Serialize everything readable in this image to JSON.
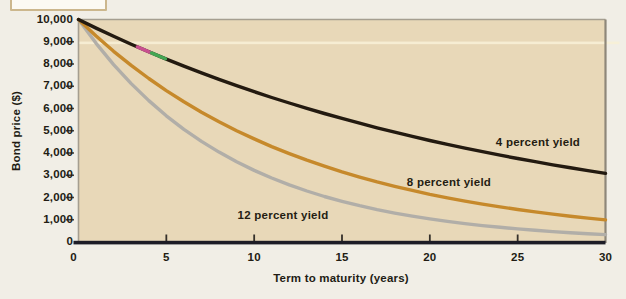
{
  "chart_data": {
    "type": "line",
    "title": "",
    "xlabel": "Term to maturity (years)",
    "ylabel": "Bond price ($)",
    "xlim": [
      0,
      30
    ],
    "ylim": [
      0,
      10000
    ],
    "x_ticks": [
      0,
      5,
      10,
      15,
      20,
      25,
      30
    ],
    "y_ticks": [
      0,
      1000,
      2000,
      3000,
      4000,
      5000,
      6000,
      7000,
      8000,
      9000,
      10000
    ],
    "grid": false,
    "legend": "inline-labels",
    "plot_bg_color": "#e8d8b8",
    "page_bg_color": "#f1eee6",
    "axis_color": "#1d1c26",
    "text_color": "#221c14",
    "x": [
      0,
      1,
      2,
      3,
      4,
      5,
      6,
      7,
      8,
      9,
      10,
      11,
      12,
      13,
      14,
      15,
      16,
      17,
      18,
      19,
      20,
      21,
      22,
      23,
      24,
      25,
      26,
      27,
      28,
      29,
      30
    ],
    "series": [
      {
        "name": "12 percent yield",
        "color": "#b1aea8",
        "label_pos": {
          "x": 283,
          "y": 215
        },
        "values": [
          10000,
          8929,
          7972,
          7118,
          6355,
          5674,
          5066,
          4523,
          4039,
          3606,
          3220,
          2875,
          2567,
          2292,
          2046,
          1827,
          1631,
          1456,
          1300,
          1161,
          1037,
          926,
          826,
          738,
          659,
          588,
          525,
          469,
          419,
          374,
          334
        ]
      },
      {
        "name": "8 percent yield",
        "color": "#c6892b",
        "label_pos": {
          "x": 449,
          "y": 182
        },
        "values": [
          10000,
          9259,
          8573,
          7938,
          7350,
          6806,
          6302,
          5835,
          5403,
          5002,
          4632,
          4289,
          3971,
          3677,
          3405,
          3152,
          2919,
          2703,
          2502,
          2317,
          2145,
          1987,
          1839,
          1703,
          1577,
          1460,
          1352,
          1252,
          1159,
          1073,
          994
        ]
      },
      {
        "name": "4 percent yield",
        "color": "#231a10",
        "label_pos": {
          "x": 538,
          "y": 142
        },
        "values": [
          10000,
          9615,
          9246,
          8890,
          8548,
          8219,
          7903,
          7599,
          7307,
          7026,
          6756,
          6496,
          6246,
          6006,
          5775,
          5553,
          5339,
          5134,
          4936,
          4746,
          4564,
          4388,
          4220,
          4057,
          3901,
          3751,
          3607,
          3468,
          3335,
          3207,
          3083
        ]
      }
    ],
    "print_artifacts": {
      "highlight_stripe": {
        "y_value": 8950,
        "color": "#f7f0d6"
      },
      "color_marks_on_series": "4 percent yield",
      "color_marks": [
        {
          "t_start": 3.35,
          "t_end": 4.15,
          "color": "#c8508f"
        },
        {
          "t_start": 4.15,
          "t_end": 4.95,
          "color": "#44a653"
        }
      ]
    }
  }
}
